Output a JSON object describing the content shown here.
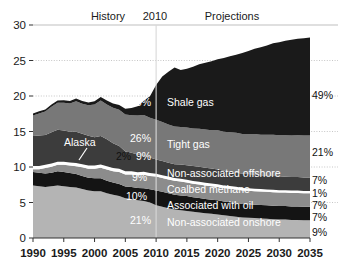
{
  "chart_data": {
    "type": "area",
    "stacked": true,
    "title": "",
    "xlabel": "",
    "ylabel": "",
    "xlim": [
      1990,
      2035
    ],
    "ylim": [
      0,
      30
    ],
    "grid": true,
    "legend_position": "inline",
    "y_ticks": [
      "0",
      "5",
      "10",
      "15",
      "20",
      "25",
      "30"
    ],
    "y_tick_values": [
      0,
      5,
      10,
      15,
      20,
      25,
      30
    ],
    "x_ticks": [
      "1990",
      "1995",
      "2000",
      "2005",
      "2010",
      "2015",
      "2020",
      "2025",
      "2030",
      "2035"
    ],
    "x_tick_values": [
      1990,
      1995,
      2000,
      2005,
      2010,
      2015,
      2020,
      2025,
      2030,
      2035
    ],
    "period_divider_year": 2010,
    "period_labels": {
      "history": "History",
      "divider": "2010",
      "projections": "Projections"
    },
    "annotation_callout": {
      "label": "Alaska",
      "x": 2001,
      "y": 12.6
    },
    "x": [
      1990,
      1991,
      1992,
      1993,
      1994,
      1995,
      1996,
      1997,
      1998,
      1999,
      2000,
      2001,
      2002,
      2003,
      2004,
      2005,
      2006,
      2007,
      2008,
      2009,
      2010,
      2011,
      2012,
      2013,
      2014,
      2015,
      2016,
      2017,
      2018,
      2019,
      2020,
      2021,
      2022,
      2023,
      2024,
      2025,
      2026,
      2027,
      2028,
      2029,
      2030,
      2031,
      2032,
      2033,
      2034,
      2035
    ],
    "series": [
      {
        "name": "Non-associated onshore",
        "label": "Non-associated onshore",
        "color": "#b4b4b4",
        "pct_2010": "21%",
        "pct_2035": "9%",
        "label_color": "light",
        "values": [
          7.4,
          7.3,
          7.2,
          7.3,
          7.4,
          7.3,
          7.2,
          7.1,
          6.9,
          6.7,
          6.6,
          6.6,
          6.3,
          6.1,
          5.9,
          5.6,
          5.5,
          5.3,
          5.2,
          5.0,
          4.6,
          4.4,
          4.2,
          4.0,
          3.9,
          3.8,
          3.7,
          3.6,
          3.5,
          3.4,
          3.3,
          3.2,
          3.1,
          3.0,
          2.9,
          2.85,
          2.8,
          2.75,
          2.7,
          2.65,
          2.6,
          2.6,
          2.55,
          2.55,
          2.5,
          2.5
        ]
      },
      {
        "name": "Associated with oil",
        "label": "Associated with oil",
        "color": "#141414",
        "pct_2010": "10%",
        "pct_2035": "7%",
        "label_color": "light",
        "values": [
          1.9,
          1.9,
          1.9,
          1.9,
          2.0,
          2.0,
          1.95,
          1.9,
          1.85,
          1.8,
          1.8,
          1.8,
          1.75,
          1.7,
          1.7,
          1.65,
          1.7,
          1.75,
          1.8,
          1.85,
          2.1,
          2.1,
          2.1,
          2.1,
          2.1,
          2.1,
          2.05,
          2.05,
          2.0,
          2.0,
          2.0,
          1.95,
          1.95,
          1.95,
          1.9,
          1.9,
          1.9,
          1.9,
          1.9,
          1.9,
          1.9,
          1.9,
          1.9,
          1.9,
          1.9,
          1.9
        ]
      },
      {
        "name": "Coalbed methane",
        "label": "Coalbed methane",
        "color": "#8c8c8c",
        "pct_2010": "9%",
        "pct_2035": "7%",
        "label_color": "light",
        "values": [
          0.4,
          0.5,
          0.75,
          0.85,
          0.9,
          1.0,
          1.05,
          1.1,
          1.2,
          1.25,
          1.35,
          1.5,
          1.6,
          1.6,
          1.7,
          1.7,
          1.75,
          1.8,
          1.9,
          1.9,
          1.95,
          1.95,
          1.95,
          1.95,
          1.95,
          1.9,
          1.9,
          1.9,
          1.9,
          1.9,
          1.9,
          1.9,
          1.9,
          1.9,
          1.9,
          1.9,
          1.9,
          1.9,
          1.9,
          1.9,
          1.9,
          1.9,
          1.9,
          1.9,
          1.9,
          1.9
        ]
      },
      {
        "name": "Alaska",
        "label": "Alaska",
        "color": "#ffffff",
        "pct_2010": "2%",
        "pct_2035": "1%",
        "label_color": "dark",
        "values": [
          0.45,
          0.45,
          0.45,
          0.45,
          0.45,
          0.45,
          0.45,
          0.45,
          0.45,
          0.45,
          0.45,
          0.45,
          0.45,
          0.45,
          0.45,
          0.45,
          0.45,
          0.42,
          0.42,
          0.4,
          0.4,
          0.4,
          0.4,
          0.4,
          0.4,
          0.4,
          0.38,
          0.38,
          0.38,
          0.38,
          0.36,
          0.36,
          0.36,
          0.36,
          0.35,
          0.35,
          0.35,
          0.35,
          0.33,
          0.33,
          0.33,
          0.33,
          0.33,
          0.33,
          0.33,
          0.33
        ]
      },
      {
        "name": "Non-associated offshore",
        "label": "Non-associated offshore",
        "color": "#3c3c3c",
        "pct_2010": "9%",
        "pct_2035": "7%",
        "label_color": "light",
        "values": [
          4.2,
          4.3,
          4.2,
          4.4,
          4.5,
          4.4,
          4.3,
          4.4,
          4.3,
          4.2,
          4.0,
          4.0,
          3.8,
          3.5,
          3.2,
          2.8,
          2.6,
          2.5,
          2.3,
          2.2,
          2.0,
          2.0,
          1.95,
          1.95,
          2.0,
          2.05,
          2.1,
          2.1,
          2.1,
          2.1,
          2.1,
          2.05,
          2.05,
          2.0,
          2.0,
          2.0,
          2.0,
          1.95,
          1.95,
          1.95,
          1.95,
          1.9,
          1.9,
          1.9,
          1.9,
          1.9
        ]
      },
      {
        "name": "Tight gas",
        "label": "Tight gas",
        "color": "#787878",
        "pct_2010": "26%",
        "pct_2035": "21%",
        "label_color": "light",
        "values": [
          2.9,
          3.1,
          3.3,
          3.6,
          3.8,
          3.9,
          4.0,
          4.3,
          4.2,
          4.3,
          4.6,
          5.0,
          4.9,
          5.0,
          5.1,
          5.2,
          5.3,
          5.5,
          5.7,
          5.6,
          5.6,
          5.5,
          5.4,
          5.3,
          5.3,
          5.3,
          5.3,
          5.35,
          5.4,
          5.4,
          5.5,
          5.5,
          5.55,
          5.6,
          5.6,
          5.65,
          5.7,
          5.7,
          5.75,
          5.8,
          5.8,
          5.85,
          5.85,
          5.9,
          5.9,
          5.9
        ]
      },
      {
        "name": "Shale gas",
        "label": "Shale gas",
        "color": "#1a1a1a",
        "pct_2010": "23%",
        "pct_2035": "49%",
        "label_color": "light",
        "values": [
          0.3,
          0.3,
          0.3,
          0.3,
          0.3,
          0.35,
          0.35,
          0.4,
          0.4,
          0.4,
          0.45,
          0.5,
          0.55,
          0.6,
          0.7,
          0.8,
          1.0,
          1.3,
          2.0,
          3.0,
          4.9,
          6.4,
          7.4,
          8.3,
          8.0,
          8.3,
          8.7,
          9.1,
          9.4,
          9.7,
          10.0,
          10.4,
          10.7,
          11.0,
          11.4,
          11.7,
          12.0,
          12.3,
          12.6,
          12.9,
          13.1,
          13.3,
          13.5,
          13.6,
          13.7,
          13.8
        ]
      }
    ]
  },
  "axis": {
    "y_ticks": [
      "30",
      "25",
      "20",
      "15",
      "10",
      "5",
      "0"
    ],
    "x_ticks": [
      "1990",
      "1995",
      "2000",
      "2005",
      "2010",
      "2015",
      "2020",
      "2025",
      "2030",
      "2035"
    ]
  },
  "headers": {
    "history": "History",
    "divider_year": "2010",
    "projections": "Projections"
  },
  "series_labels": {
    "shale_gas": "Shale gas",
    "tight_gas": "Tight gas",
    "non_assoc_offshore": "Non-associated offshore",
    "coalbed_methane": "Coalbed methane",
    "associated_with_oil": "Associated with oil",
    "non_assoc_onshore": "Non-associated onshore",
    "alaska": "Alaska"
  },
  "pct_2010": {
    "shale_gas": "23%",
    "tight_gas": "26%",
    "alaska": "2%",
    "non_assoc_offshore": "9%",
    "coalbed_methane": "9%",
    "associated_with_oil": "10%",
    "non_assoc_onshore": "21%"
  },
  "pct_2035": {
    "shale_gas": "49%",
    "tight_gas": "21%",
    "non_assoc_offshore": "7%",
    "coalbed_methane": "1%",
    "associated_with_oil": "7%",
    "non_assoc_onshore_upper": "7%",
    "non_assoc_onshore": "9%"
  },
  "colors": {
    "shale_gas": "#1a1a1a",
    "tight_gas": "#787878",
    "non_assoc_offshore": "#3c3c3c",
    "alaska": "#ffffff",
    "coalbed_methane": "#8c8c8c",
    "associated_with_oil": "#141414",
    "non_assoc_onshore": "#b4b4b4",
    "gridline": "#bfbfbf",
    "axis": "#333333",
    "divider": "#d8d8d8",
    "background": "#ffffff"
  }
}
